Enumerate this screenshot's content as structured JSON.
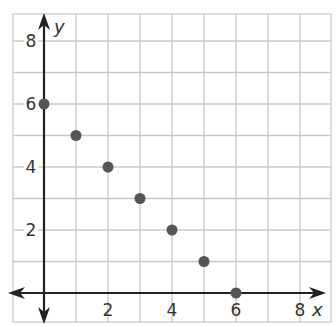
{
  "chart_data": {
    "type": "scatter",
    "title": "",
    "xlabel": "x",
    "ylabel": "y",
    "xlim": [
      -1,
      9
    ],
    "ylim": [
      -1,
      9
    ],
    "grid": true,
    "x_ticks": [
      "2",
      "4",
      "6",
      "8"
    ],
    "y_ticks": [
      "2",
      "4",
      "6",
      "8"
    ],
    "series": [
      {
        "name": "points",
        "x": [
          0,
          1,
          2,
          3,
          4,
          5,
          6
        ],
        "y": [
          6,
          5,
          4,
          3,
          2,
          1,
          0
        ]
      }
    ],
    "colors": {
      "point": "#555555",
      "grid": "#c8c8c8",
      "axis": "#222222"
    }
  }
}
